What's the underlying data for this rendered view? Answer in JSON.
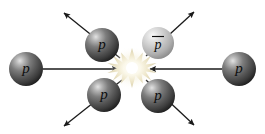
{
  "diagram": {
    "background_color": "#ffffff",
    "width": 265,
    "height": 134
  },
  "colors": {
    "proton_dark": "#555555",
    "proton_light_highlight": "#d8d8d8",
    "proton_shadow": "#1a1a1a",
    "antiproton_base": "#bdbdbd",
    "antiproton_highlight": "#f2f2f2",
    "antiproton_shadow": "#6e6e6e",
    "burst_core": "#ffffff",
    "burst_glow": "#efe9d2",
    "burst_edge": "#cfc8ad",
    "arrow_color": "#1a1a1a",
    "label_color": "#000000"
  },
  "burst": {
    "name": "collision-burst",
    "cx": 132,
    "cy": 68,
    "outer_radius": 20,
    "inner_radius": 8,
    "points": 14
  },
  "particles": [
    {
      "id": "incoming-proton-left",
      "label": "p",
      "overbar": false,
      "kind": "proton",
      "cx": 26,
      "cy": 69,
      "r": 17,
      "font_size": 15
    },
    {
      "id": "incoming-proton-right",
      "label": "p",
      "overbar": false,
      "kind": "proton",
      "cx": 239,
      "cy": 69,
      "r": 17,
      "font_size": 15
    },
    {
      "id": "outgoing-proton-upper-left",
      "label": "p",
      "overbar": false,
      "kind": "proton",
      "cx": 102,
      "cy": 45,
      "r": 17,
      "font_size": 15
    },
    {
      "id": "outgoing-antiproton-upper-right",
      "label": "p",
      "overbar": true,
      "kind": "antiproton",
      "cx": 158,
      "cy": 43,
      "r": 16,
      "font_size": 14
    },
    {
      "id": "outgoing-proton-lower-left",
      "label": "p",
      "overbar": false,
      "kind": "proton",
      "cx": 104,
      "cy": 95,
      "r": 17,
      "font_size": 15
    },
    {
      "id": "outgoing-proton-lower-right",
      "label": "p",
      "overbar": false,
      "kind": "proton",
      "cx": 158,
      "cy": 96,
      "r": 17,
      "font_size": 15
    }
  ],
  "arrows": [
    {
      "id": "arrow-incoming-left",
      "direction": "right",
      "description": "left proton travelling right into collision point",
      "x1": 43,
      "y1": 69,
      "x2": 118,
      "y2": 69,
      "head": "end"
    },
    {
      "id": "arrow-incoming-right",
      "direction": "left",
      "description": "right proton travelling left into collision point",
      "x1": 222,
      "y1": 69,
      "x2": 148,
      "y2": 69,
      "head": "end"
    },
    {
      "id": "arrow-outgoing-upper-left",
      "direction": "up-left",
      "description": "proton scattering out to upper left",
      "x1": 120,
      "y1": 58,
      "x2": 62,
      "y2": 11,
      "head": "end"
    },
    {
      "id": "arrow-outgoing-upper-right",
      "direction": "up-right",
      "description": "antiproton scattering out to upper right",
      "x1": 146,
      "y1": 56,
      "x2": 196,
      "y2": 10,
      "head": "end"
    },
    {
      "id": "arrow-outgoing-lower-left",
      "direction": "down-left",
      "description": "proton scattering out to lower left",
      "x1": 122,
      "y1": 80,
      "x2": 62,
      "y2": 128,
      "head": "end"
    },
    {
      "id": "arrow-outgoing-lower-right",
      "direction": "down-right",
      "description": "proton scattering out to lower right",
      "x1": 146,
      "y1": 80,
      "x2": 196,
      "y2": 127,
      "head": "end"
    }
  ]
}
